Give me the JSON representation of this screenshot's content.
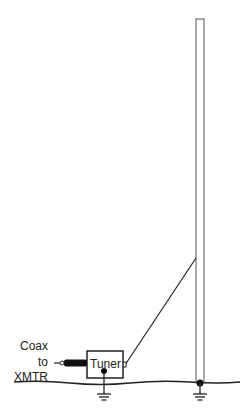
{
  "diagram": {
    "labels": {
      "coax": "Coax",
      "to": "to",
      "xmtr": "XMTR",
      "tuner": "Tuner"
    },
    "colors": {
      "line": "#222222",
      "mast": "#444444",
      "background": "#ffffff"
    },
    "elements": [
      "vertical-mast",
      "ground-line",
      "tuner-box",
      "coax-cable",
      "feed-wire",
      "ground-symbol-tuner",
      "ground-symbol-mast"
    ]
  }
}
